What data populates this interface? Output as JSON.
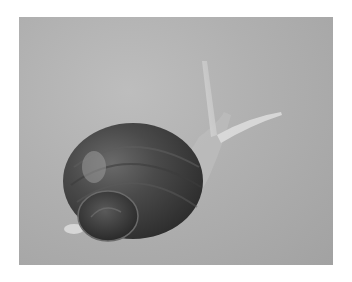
{
  "image": {
    "subject": "snail",
    "description": "Grayscale photograph of a garden snail with a dark spiral shell crawling on a light gray surface, tentacles extended toward the upper right",
    "colors": {
      "background_page": "#ffffff",
      "surface": "#b0b0b0",
      "shell_dark": "#3a3a3a",
      "shell_mid": "#555555",
      "body": "#c8c8c8"
    }
  }
}
